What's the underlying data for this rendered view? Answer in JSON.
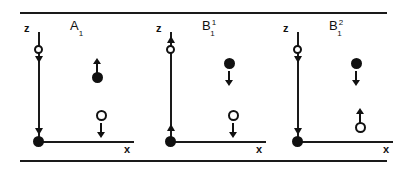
{
  "figure": {
    "axis_labels": {
      "z": "z",
      "x": "x"
    },
    "line_color": "#111111",
    "background": "#ffffff"
  },
  "panels": [
    {
      "id": "A1",
      "title_base": "A",
      "title_sub": "1",
      "title_sup": "",
      "z_axis": {
        "label": "z",
        "head_top_direction": "down",
        "head_bottom_direction": "down",
        "circle_on_axis": {
          "fill": "open",
          "position_y": 32
        },
        "origin_marker": {
          "fill": "filled"
        }
      },
      "x_axis": {
        "label": "x"
      },
      "particles": [
        {
          "name": "upper-filled-atom",
          "fill": "filled",
          "arrow": "up",
          "arrow_position": "above",
          "x": 74,
          "y": 44
        },
        {
          "name": "lower-open-atom",
          "fill": "open",
          "arrow": "down",
          "arrow_position": "below",
          "x": 78,
          "y": 96
        }
      ]
    },
    {
      "id": "B1^1",
      "title_base": "B",
      "title_sub": "1",
      "title_sup": "1",
      "z_axis": {
        "label": "z",
        "head_top_direction": "up",
        "head_bottom_direction": "up",
        "circle_on_axis": {
          "fill": "open",
          "position_y": 32
        },
        "origin_marker": {
          "fill": "filled"
        }
      },
      "x_axis": {
        "label": "x"
      },
      "particles": [
        {
          "name": "upper-filled-atom",
          "fill": "filled",
          "arrow": "down",
          "arrow_position": "below",
          "x": 74,
          "y": 44
        },
        {
          "name": "lower-open-atom",
          "fill": "open",
          "arrow": "down",
          "arrow_position": "below",
          "x": 78,
          "y": 96
        }
      ]
    },
    {
      "id": "B1^2",
      "title_base": "B",
      "title_sub": "1",
      "title_sup": "2",
      "z_axis": {
        "label": "z",
        "head_top_direction": "down",
        "head_bottom_direction": "down",
        "circle_on_axis": {
          "fill": "open",
          "position_y": 32
        },
        "origin_marker": {
          "fill": "filled"
        }
      },
      "x_axis": {
        "label": "x"
      },
      "particles": [
        {
          "name": "upper-filled-atom",
          "fill": "filled",
          "arrow": "down",
          "arrow_position": "below",
          "x": 74,
          "y": 44
        },
        {
          "name": "lower-open-atom",
          "fill": "open",
          "arrow": "up",
          "arrow_position": "above",
          "x": 78,
          "y": 96
        }
      ]
    }
  ]
}
